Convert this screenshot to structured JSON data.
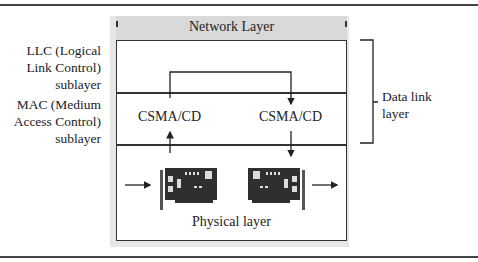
{
  "diagram": {
    "network_layer": "Network Layer",
    "llc_label": [
      "LLC (Logical",
      "Link Control)",
      "sublayer"
    ],
    "mac_label": [
      "MAC (Medium",
      "Access Control)",
      "sublayer"
    ],
    "csma_left": "CSMA/CD",
    "csma_right": "CSMA/CD",
    "physical_layer": "Physical layer",
    "data_link_label": [
      "Data link",
      "layer"
    ],
    "icons": [
      "network-card-icon",
      "network-card-icon"
    ]
  }
}
